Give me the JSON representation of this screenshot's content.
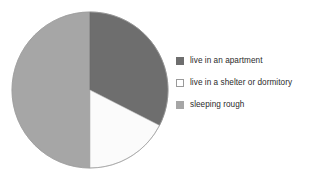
{
  "chart_data": {
    "type": "pie",
    "title": "",
    "subtitle": "",
    "xlabel": "",
    "ylabel": "",
    "grid": false,
    "legend_position": "right",
    "start_angle_deg": 0,
    "direction": "clockwise",
    "categories": [
      "live in an apartment",
      "live in a shelter or dormitory",
      "sleeping rough"
    ],
    "values": [
      32.5,
      17.5,
      50.0
    ],
    "units": "percent",
    "slices": [
      {
        "label": "live in an apartment",
        "value": 32.5,
        "color": "#6e6e6e",
        "start_angle_deg": 0,
        "end_angle_deg": 117
      },
      {
        "label": "live in a shelter or dormitory",
        "value": 17.5,
        "color": "#fbfbfb",
        "start_angle_deg": 117,
        "end_angle_deg": 180
      },
      {
        "label": "sleeping rough",
        "value": 50.0,
        "color": "#a6a6a6",
        "start_angle_deg": 180,
        "end_angle_deg": 360
      }
    ],
    "geometry": {
      "center_x": 90,
      "center_y": 90,
      "radius": 78
    }
  },
  "legend": {
    "items": [
      {
        "label": "live in an apartment",
        "swatch_name": "legend-swatch-apartment",
        "color": "#6e6e6e",
        "border": "#6e6e6e"
      },
      {
        "label": "live in a shelter or dormitory",
        "swatch_name": "legend-swatch-shelter",
        "color": "#ffffff",
        "border": "#9a9a9a"
      },
      {
        "label": "sleeping rough",
        "swatch_name": "legend-swatch-rough",
        "color": "#a6a6a6",
        "border": "#a6a6a6"
      }
    ]
  },
  "colors": {
    "background": "#ffffff",
    "slice_dark": "#6e6e6e",
    "slice_white": "#fbfbfb",
    "slice_light": "#a6a6a6",
    "slice_outline": "#8f8f8f",
    "text": "#2b2b2b"
  }
}
